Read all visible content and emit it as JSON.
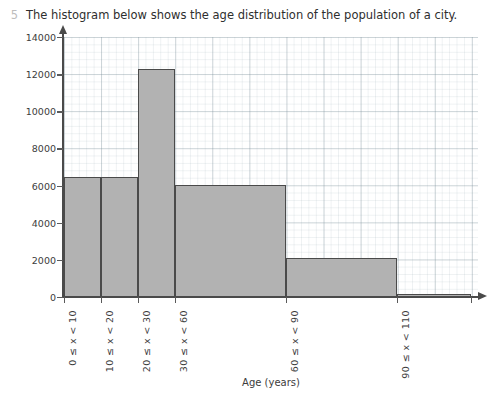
{
  "question": {
    "number": "5",
    "text": "The histogram below shows the age distribution of the population of a city."
  },
  "chart_data": {
    "type": "bar",
    "title": "",
    "xlabel": "Age (years)",
    "ylabel": "Frequency density",
    "grid": true,
    "legend": "none",
    "ylim": [
      0,
      14000
    ],
    "ytick_values": [
      0,
      2000,
      4000,
      6000,
      8000,
      10000,
      12000,
      14000
    ],
    "ytick_labels": [
      "0",
      "2000",
      "4000",
      "6000",
      "8000",
      "10000",
      "12000",
      "14000"
    ],
    "xlim": [
      0,
      112
    ],
    "xtick_values": [
      0,
      10,
      20,
      30,
      60,
      90,
      110
    ],
    "categories": [
      "0 ≤ x < 10",
      "10 ≤ x < 20",
      "20 ≤ x < 30",
      "30 ≤ x < 60",
      "60 ≤ x < 90",
      "90 ≤ x < 110"
    ],
    "bins": [
      {
        "label": "0 ≤ x < 10",
        "x_start": 0,
        "x_end": 10,
        "value": 6450
      },
      {
        "label": "10 ≤ x < 20",
        "x_start": 10,
        "x_end": 20,
        "value": 6450
      },
      {
        "label": "20 ≤ x < 30",
        "x_start": 20,
        "x_end": 30,
        "value": 12300
      },
      {
        "label": "30 ≤ x < 60",
        "x_start": 30,
        "x_end": 60,
        "value": 6050
      },
      {
        "label": "60 ≤ x < 90",
        "x_start": 60,
        "x_end": 90,
        "value": 2100
      },
      {
        "label": "90 ≤ x < 110",
        "x_start": 90,
        "x_end": 110,
        "value": 150
      }
    ],
    "values": [
      6450,
      6450,
      12300,
      6050,
      2100,
      150
    ],
    "colors": {
      "bar_fill": "#b2b2b2",
      "bar_edge": "#4a4a4a",
      "axis": "#4a4a4a",
      "grid_major": "#8aa0a8",
      "grid_minor": "#c3d0d6",
      "text": "#3c3c3c",
      "question_number": "#bdbdbd"
    }
  }
}
